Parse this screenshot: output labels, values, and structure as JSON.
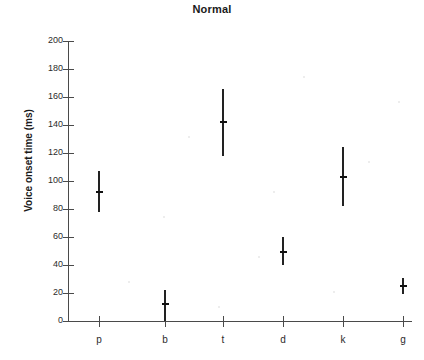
{
  "chart_data": {
    "type": "scatter",
    "title": "Normal",
    "xlabel": "",
    "ylabel": "Voice onset time (ms)",
    "categories": [
      "p",
      "b",
      "t",
      "d",
      "k",
      "g"
    ],
    "values": [
      92,
      12,
      142,
      49,
      103,
      25
    ],
    "error_low": [
      78,
      0,
      118,
      40,
      82,
      19
    ],
    "error_high": [
      107,
      22,
      166,
      60,
      124,
      31
    ],
    "ylim": [
      0,
      200
    ],
    "y_ticks": [
      0,
      20,
      40,
      60,
      80,
      100,
      120,
      140,
      160,
      180,
      200
    ],
    "y_tick_labels": [
      "0",
      "20",
      "40",
      "60",
      "80",
      "100",
      "120",
      "140",
      "160",
      "180",
      "200"
    ],
    "grid": false,
    "legend": false,
    "legend_position": "none",
    "series": [
      {
        "name": "Voice onset time",
        "points": [
          {
            "category": "p",
            "mean": 92,
            "low": 78,
            "high": 107
          },
          {
            "category": "b",
            "mean": 12,
            "low": 0,
            "high": 22
          },
          {
            "category": "t",
            "mean": 142,
            "low": 118,
            "high": 166
          },
          {
            "category": "d",
            "mean": 49,
            "low": 40,
            "high": 60
          },
          {
            "category": "k",
            "mean": 103,
            "low": 82,
            "high": 124
          },
          {
            "category": "g",
            "mean": 25,
            "low": 19,
            "high": 31
          }
        ]
      }
    ]
  },
  "colors": {
    "axis": "#4a4a4a",
    "data": "#222222",
    "text": "#2b2b2b",
    "background": "#ffffff"
  }
}
